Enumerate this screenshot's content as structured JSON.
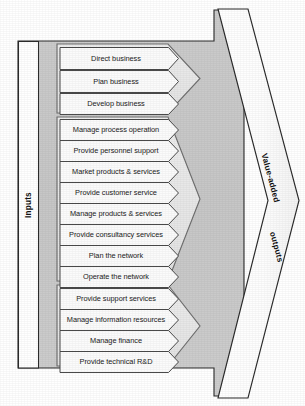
{
  "diagram": {
    "inputs_label": "Inputs",
    "outputs_label_line1": "Value-added",
    "outputs_label_line2": "outputs",
    "colors": {
      "body_fill": "#c9c9c9",
      "band_fill": "#ffffff",
      "group_fill": "#e8e8e8",
      "chevron_fill": "#fbfbfb",
      "outline": "#2b2b2b",
      "text": "#1a1a1a"
    },
    "groups": [
      {
        "name": "strategy-group",
        "processes": [
          "Direct business",
          "Plan business",
          "Develop business"
        ]
      },
      {
        "name": "core-operations-group",
        "processes": [
          "Manage process operation",
          "Provide personnel support",
          "Market products & services",
          "Provide customer service",
          "Manage products & services",
          "Provide consultancy services",
          "Plan the network",
          "Operate the network"
        ]
      },
      {
        "name": "support-group",
        "processes": [
          "Provide support services",
          "Manage information resources",
          "Manage finance",
          "Provide technical R&D"
        ]
      }
    ]
  }
}
